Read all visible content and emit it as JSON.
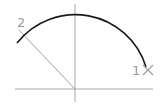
{
  "diagram": {
    "type": "arc-construction",
    "colors": {
      "arc": "#1a1a1a",
      "construction": "#a0a0a0",
      "labels": "#9a9a9a",
      "background": "#ffffff"
    },
    "axes": {
      "horizontal": {
        "x1": 15,
        "y1": 89,
        "x2": 153,
        "y2": 89
      },
      "vertical": {
        "x1": 75,
        "y1": 4,
        "x2": 75,
        "y2": 102
      }
    },
    "center": {
      "x": 75,
      "y": 89
    },
    "arc": {
      "start": {
        "x": 146,
        "y": 67
      },
      "end": {
        "x": 17,
        "y": 43
      },
      "radius": 74
    },
    "radial_line": {
      "x1": 19,
      "y1": 30,
      "x2": 75,
      "y2": 89
    },
    "points": [
      {
        "label": "1",
        "marker": "cross",
        "x": 148,
        "y": 70
      },
      {
        "label": "2",
        "marker": "none",
        "x": 20,
        "y": 30
      }
    ]
  }
}
